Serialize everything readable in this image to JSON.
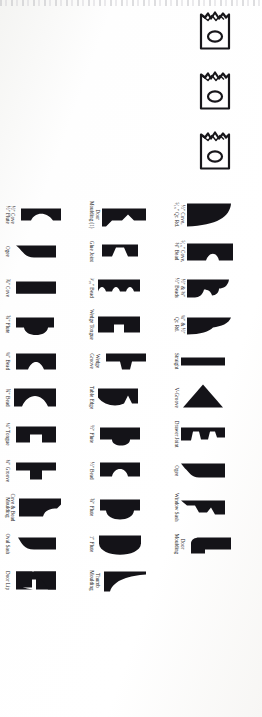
{
  "page": {
    "kind": "scanned-book-page",
    "orientation": "rotated-90-clockwise",
    "ink_color": "#141318",
    "paper_color": "#fdfdfc"
  },
  "knife_blanks": {
    "label": "moulder-knife-blank",
    "count": 3,
    "description": "three outlined shaper knife blanks with oval mounting holes"
  },
  "grid": {
    "columns": 14,
    "rows": 3,
    "rows_data": [
      {
        "row_name": "row-1",
        "cells": [
          {
            "label": "½\" Cove,\n⁵⁄₁₆\" Qr. Rd.",
            "shape": "cove-quarter-round"
          },
          {
            "label": "⁵⁄₁₆\" Cove,\n⅜\" Bead",
            "shape": "cove-bead"
          },
          {
            "label": "½\" & ⅜\"\n½\" Beads",
            "shape": "double-bead"
          },
          {
            "label": "¼\" & ½\"\nQr. Rd.",
            "shape": "quarter-round-pair"
          },
          {
            "label": "Straight",
            "shape": "straight"
          },
          {
            "label": "V-Groove",
            "shape": "v-groove"
          },
          {
            "label": "Drawer Joint",
            "shape": "drawer-joint"
          },
          {
            "label": "Ogee",
            "shape": "ogee"
          },
          {
            "label": "Window Sash",
            "shape": "window-sash"
          },
          {
            "label": "Door\nMoulding",
            "shape": "door-moulding"
          }
        ]
      },
      {
        "row_name": "row-2",
        "cells": [
          {
            "label": "Door\nMoulding (1)",
            "shape": "door-moulding-1"
          },
          {
            "label": "Glue Joint",
            "shape": "glue-joint"
          },
          {
            "label": "³⁄₁₆\" Bead",
            "shape": "bead-3-16"
          },
          {
            "label": "Wedge Tongue",
            "shape": "wedge-tongue"
          },
          {
            "label": "Wedge\nGroove",
            "shape": "wedge-groove"
          },
          {
            "label": "Table Edge",
            "shape": "table-edge"
          },
          {
            "label": "½\" Flute",
            "shape": "flute-half"
          },
          {
            "label": "½\" Bead",
            "shape": "bead-half"
          },
          {
            "label": "¾\" Flute",
            "shape": "flute-three-quarter"
          },
          {
            "label": "1\" Flute",
            "shape": "flute-one-inch"
          },
          {
            "label": "Thumb\nMoulding",
            "shape": "thumb-moulding"
          }
        ]
      },
      {
        "row_name": "row-3",
        "cells": [
          {
            "label": "½\" Cove\n½\" Flute",
            "shape": "cove-flute"
          },
          {
            "label": "Ogee",
            "shape": "ogee-2"
          },
          {
            "label": "¾\" Cove",
            "shape": "cove-three-quarter"
          },
          {
            "label": "¾\" Flute",
            "shape": "flute-three-quarter-2"
          },
          {
            "label": "¼\" Bead",
            "shape": "bead-quarter"
          },
          {
            "label": "¾\" Bead",
            "shape": "bead-three-quarter"
          },
          {
            "label": "¼\" Tongue",
            "shape": "tongue-quarter"
          },
          {
            "label": "¼\" Groove",
            "shape": "groove-quarter"
          },
          {
            "label": "Cove & Bead\nMoulding",
            "shape": "cove-bead-moulding"
          },
          {
            "label": "Oval Sash",
            "shape": "oval-sash"
          },
          {
            "label": "Door Lip",
            "shape": "door-lip"
          }
        ]
      }
    ]
  }
}
